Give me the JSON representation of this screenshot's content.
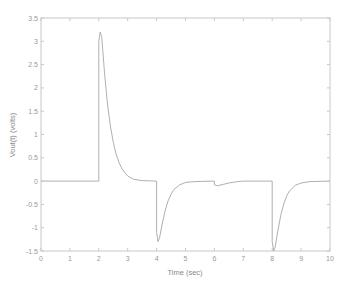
{
  "chart_data": {
    "type": "line",
    "title": "",
    "xlabel": "Time (sec)",
    "ylabel": "Vout(t) (volts)",
    "xlim": [
      0,
      10
    ],
    "ylim": [
      -1.5,
      3.5
    ],
    "xticks": [
      0,
      1,
      2,
      3,
      4,
      5,
      6,
      7,
      8,
      9,
      10
    ],
    "yticks": [
      -1.5,
      -1,
      -0.5,
      0,
      0.5,
      1,
      1.5,
      2,
      2.5,
      3,
      3.5
    ],
    "ytick_labels": [
      "-1.5",
      "-1",
      "-0.5",
      "0",
      "0.5",
      "1",
      "1.5",
      "2",
      "2.5",
      "3",
      "3.5"
    ],
    "grid": false,
    "legend": null,
    "colors": {
      "line": "#b0b0b0",
      "axis": "#c8c8c8",
      "text": "#9a9a9a"
    },
    "series": [
      {
        "name": "Vout(t)",
        "x": [
          0,
          2.0,
          2.0,
          2.05,
          2.1,
          2.2,
          2.3,
          2.4,
          2.5,
          2.6,
          2.7,
          2.8,
          2.9,
          3.0,
          3.2,
          3.5,
          4.0,
          4.0,
          4.05,
          4.1,
          4.2,
          4.3,
          4.4,
          4.5,
          4.6,
          4.8,
          5.0,
          5.3,
          6.0,
          6.0,
          6.1,
          6.3,
          6.5,
          6.8,
          7.0,
          8.0,
          8.0,
          8.05,
          8.1,
          8.2,
          8.3,
          8.4,
          8.5,
          8.6,
          8.8,
          9.0,
          9.3,
          10
        ],
        "y": [
          0,
          0,
          3.0,
          3.2,
          3.1,
          2.3,
          1.65,
          1.18,
          0.83,
          0.58,
          0.4,
          0.27,
          0.18,
          0.11,
          0.04,
          0.01,
          0,
          -1.1,
          -1.3,
          -1.22,
          -0.9,
          -0.62,
          -0.42,
          -0.28,
          -0.18,
          -0.08,
          -0.03,
          -0.01,
          0,
          -0.08,
          -0.1,
          -0.07,
          -0.04,
          -0.01,
          0,
          0,
          -1.3,
          -1.5,
          -1.42,
          -1.05,
          -0.72,
          -0.49,
          -0.32,
          -0.21,
          -0.09,
          -0.04,
          -0.01,
          0
        ]
      }
    ]
  }
}
